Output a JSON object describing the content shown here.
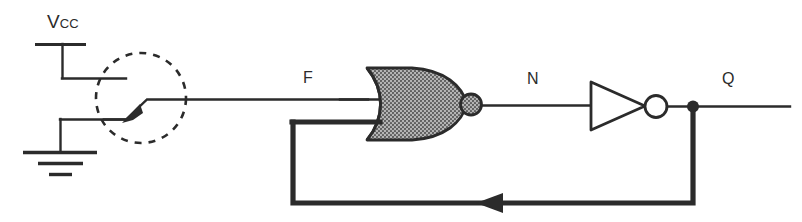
{
  "diagram": {
    "type": "logic-circuit-schematic",
    "background_color": "#ffffff",
    "line_color": "#2b2b2b",
    "gate_fill_color": "#9a9a9a"
  },
  "labels": {
    "supply": {
      "name": "Vcc",
      "main": "V",
      "subscript": "CC"
    },
    "node_f": "F",
    "node_n": "N",
    "node_q": "Q"
  },
  "components": [
    {
      "id": "supply-rail",
      "kind": "power-rail",
      "label": "Vcc"
    },
    {
      "id": "switch",
      "kind": "spdt-switch",
      "label": "",
      "highlighted": true,
      "highlight_shape": "dashed-circle"
    },
    {
      "id": "ground",
      "kind": "ground-symbol",
      "label": ""
    },
    {
      "id": "nor-gate",
      "kind": "nor-gate",
      "label": "",
      "inputs": [
        "F",
        "Q"
      ],
      "output": "N",
      "inverted_output": true,
      "fill": "stippled-gray"
    },
    {
      "id": "inverter",
      "kind": "not-gate",
      "label": "",
      "inputs": [
        "N"
      ],
      "output": "Q",
      "inverted_output": true,
      "fill": "white"
    },
    {
      "id": "feedback-path",
      "kind": "feedback-wire",
      "label": "",
      "from": "Q",
      "to": "nor-gate-input-2",
      "direction": "right-to-left"
    }
  ],
  "nets": [
    {
      "id": "net-f",
      "label": "F",
      "from": "switch",
      "to": "nor-gate-input-1"
    },
    {
      "id": "net-n",
      "label": "N",
      "from": "nor-gate-output",
      "to": "inverter-input"
    },
    {
      "id": "net-q",
      "label": "Q",
      "from": "inverter-output",
      "to": "output-terminal"
    }
  ]
}
